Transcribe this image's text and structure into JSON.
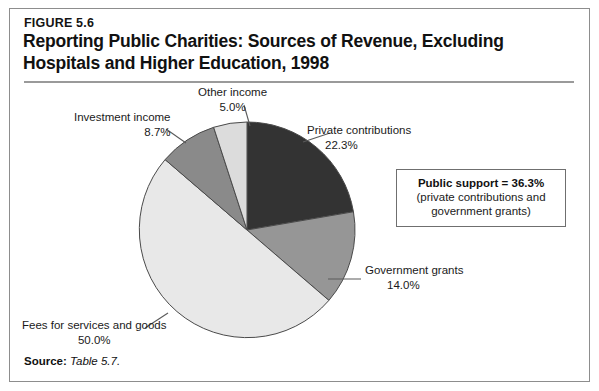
{
  "figure": {
    "number": "FIGURE 5.6",
    "title": "Reporting Public Charities: Sources of Revenue, Excluding Hospitals and Higher Education, 1998",
    "source_label": "Source:",
    "source_value": "Table 5.7."
  },
  "callout": {
    "title": "Public support = 36.3%",
    "subtitle": "(private contributions and government grants)"
  },
  "labels": {
    "other": {
      "name": "Other income",
      "pct": "5.0%"
    },
    "investment": {
      "name": "Investment income",
      "pct": "8.7%"
    },
    "private": {
      "name": "Private contributions",
      "pct": "22.3%"
    },
    "government": {
      "name": "Government grants",
      "pct": "14.0%"
    },
    "fees": {
      "name": "Fees for services and goods",
      "pct": "50.0%"
    }
  },
  "chart_data": {
    "type": "pie",
    "title": "Reporting Public Charities: Sources of Revenue, Excluding Hospitals and Higher Education, 1998",
    "categories": [
      "Private contributions",
      "Government grants",
      "Fees for services and goods",
      "Investment income",
      "Other income"
    ],
    "values": [
      22.3,
      14.0,
      50.0,
      8.7,
      5.0
    ],
    "unit": "percent",
    "colors": [
      "#333333",
      "#969696",
      "#e8e8e8",
      "#8a8a8a",
      "#dcdcdc"
    ],
    "start_angle_deg": 0,
    "direction": "clockwise",
    "legend": "none",
    "annotation": "Public support = 36.3% (private contributions and government grants)",
    "geometry": {
      "cx": 247,
      "cy": 230,
      "r": 108
    }
  }
}
